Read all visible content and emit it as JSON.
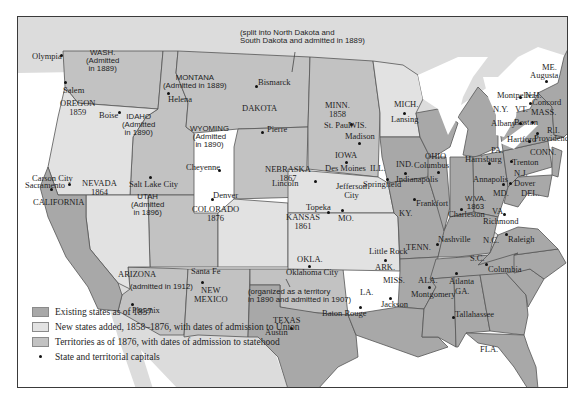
{
  "colors": {
    "existing": "#a8a8a8",
    "new_states": "#e2e2e2",
    "territories": "#c2c2c2",
    "foreign_land": "#dcdcdc",
    "water": "#ffffff",
    "border": "#555555"
  },
  "annotations": {
    "dakota_note_1": "(split into North Dakota and",
    "dakota_note_2": "South Dakota and admitted in 1889)",
    "okla_note_1": "(organized as a territory",
    "okla_note_2": "in 1890 and admitted in 1907)"
  },
  "states": {
    "wash": {
      "name": "WASH.",
      "l2": "(Admitted",
      "l3": "in 1889)",
      "capital": "Olympia"
    },
    "oregon": {
      "name": "OREGON",
      "year": "1859",
      "capital": "Salem"
    },
    "california": {
      "name": "CALIFORNIA",
      "capital": "Sacramento"
    },
    "nevada": {
      "name": "NEVADA",
      "year": "1864",
      "capital": "Carson City"
    },
    "idaho": {
      "name": "IDAHO",
      "l2": "(Admitted",
      "l3": "in 1890)",
      "capital": "Boise"
    },
    "montana": {
      "name": "MONTANA",
      "l2": "(Admitted in 1889)",
      "capital": "Helena"
    },
    "wyoming": {
      "name": "WYOMING",
      "l2": "(Admitted",
      "l3": "in 1890)",
      "capital": "Cheyenne"
    },
    "utah": {
      "name": "UTAH",
      "l2": "(Admitted",
      "l3": "in 1896)",
      "capital": "Salt Lake City"
    },
    "colorado": {
      "name": "COLORADO",
      "year": "1876",
      "capital": "Denver"
    },
    "arizona": {
      "name": "ARIZONA",
      "l2": "(admitted in 1912)",
      "capital": "Phoenix"
    },
    "new_mexico": {
      "name1": "NEW",
      "name2": "MEXICO",
      "capital": "Santa Fe"
    },
    "dakota": {
      "name": "DAKOTA",
      "capital1": "Bismarck",
      "capital2": "Pierre"
    },
    "nebraska": {
      "name": "NEBRASKA",
      "year": "1867",
      "capital": "Lincoln"
    },
    "kansas": {
      "name": "KANSAS",
      "year": "1861",
      "capital": "Topeka"
    },
    "okla": {
      "name": "OKLA.",
      "capital": "Oklahoma City"
    },
    "texas": {
      "name": "TEXAS",
      "capital": "Austin"
    },
    "minn": {
      "name": "MINN.",
      "year": "1858",
      "capital": "St. Paul"
    },
    "iowa": {
      "name": "IOWA",
      "capital": "Des Moines"
    },
    "mo": {
      "name": "MO.",
      "capital1": "Jefferson",
      "capital2": "City"
    },
    "ark": {
      "name": "ARK.",
      "capital": "Little Rock"
    },
    "la": {
      "name": "LA.",
      "capital": "Baton Rouge"
    },
    "wis": {
      "name": "WIS.",
      "capital": "Madison"
    },
    "ill": {
      "name": "ILL.",
      "capital": "Springfield"
    },
    "mich": {
      "name": "MICH.",
      "capital": "Lansing"
    },
    "ind": {
      "name": "IND.",
      "capital": "Indianapolis"
    },
    "ohio": {
      "name": "OHIO",
      "capital": "Columbus"
    },
    "ky": {
      "name": "KY.",
      "capital": "Frankfort"
    },
    "tenn": {
      "name": "TENN.",
      "capital": "Nashville"
    },
    "miss": {
      "name": "MISS.",
      "capital": "Jackson"
    },
    "ala": {
      "name": "ALA.",
      "capital": "Montgomery"
    },
    "ga": {
      "name": "GA.",
      "capital": "Atlanta"
    },
    "fla": {
      "name": "FLA.",
      "capital": "Tallahassee"
    },
    "sc": {
      "name": "S.C.",
      "capital": "Columbia"
    },
    "nc": {
      "name": "N.C.",
      "capital": "Raleigh"
    },
    "va": {
      "name": "VA.",
      "capital": "Richmond"
    },
    "wva": {
      "name": "W.VA.",
      "year": "1863",
      "capital": "Charleston"
    },
    "md": {
      "name": "MD.",
      "capital": "Annapolis"
    },
    "del": {
      "name": "DEL.",
      "capital": "Dover"
    },
    "pa": {
      "name": "PA.",
      "capital": "Harrisburg"
    },
    "nj": {
      "name": "N.J.",
      "capital": "Trenton"
    },
    "ny": {
      "name": "N.Y.",
      "capital": "Albany"
    },
    "conn": {
      "name": "CONN.",
      "capital": "Hartford"
    },
    "ri": {
      "name": "R.I.",
      "capital": "Providence"
    },
    "mass": {
      "name": "MASS.",
      "capital": "Boston"
    },
    "vt": {
      "name": "VT.",
      "capital": "Montpelier"
    },
    "nh": {
      "name": "N.H.",
      "capital": "Concord"
    },
    "me": {
      "name": "ME.",
      "capital": "Augusta"
    }
  },
  "legend": {
    "items": [
      {
        "label": "Existing states as of 1857",
        "swatch": "existing"
      },
      {
        "label": "New states added, 1858–1876, with dates of admission to Union",
        "swatch": "new_states"
      },
      {
        "label": "Territories as of 1876, with dates of admission to statehood",
        "swatch": "territories"
      },
      {
        "label": "State and territorial capitals",
        "swatch": "dot"
      }
    ]
  }
}
